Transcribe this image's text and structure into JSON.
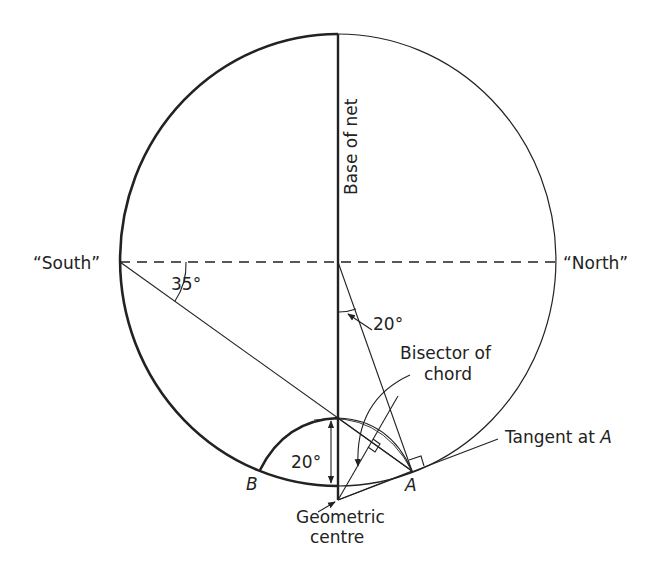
{
  "figure": {
    "type": "stereographic net construction",
    "colors": {
      "stroke": "#222222",
      "background": "#ffffff"
    }
  },
  "labels": {
    "base_of_net": "Base of net",
    "south": "“South”",
    "north": "“North”",
    "angle_35": "35°",
    "angle_20_top": "20°",
    "bisector_line1": "Bisector of",
    "bisector_line2": "chord",
    "tangent": "Tangent at ",
    "tangent_point": "A",
    "angle_20_bottom": "20°",
    "point_b": "B",
    "point_a": "A",
    "geometric_line1": "Geometric",
    "geometric_line2": "centre"
  }
}
